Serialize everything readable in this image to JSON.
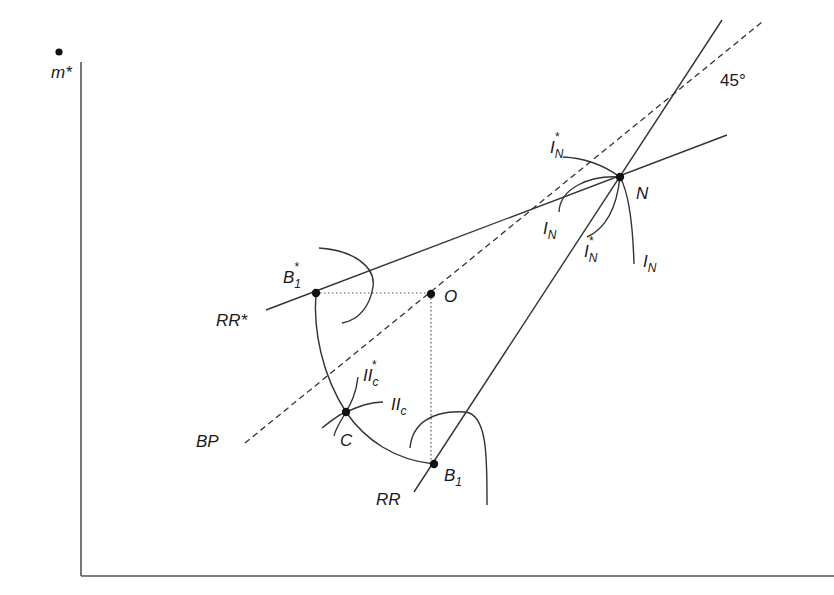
{
  "diagram": {
    "axes": {
      "y_label": "m*",
      "x_label": ""
    },
    "lines": {
      "bp_label": "BP",
      "bp_angle_label": "45°",
      "rr_label": "RR",
      "rr_star_label": "RR*"
    },
    "points": {
      "n": "N",
      "o": "O",
      "c": "C",
      "b1": "B",
      "b1_sub": "1",
      "b1_star": "B",
      "b1_star_sup": "*",
      "b1_star_sub": "1"
    },
    "curves": {
      "i_n_base": "I",
      "i_n_sub": "N",
      "i_n_star_sup": "*",
      "ii_c_base": "II",
      "ii_c_sub": "c",
      "ii_c_star_sup": "*"
    }
  }
}
